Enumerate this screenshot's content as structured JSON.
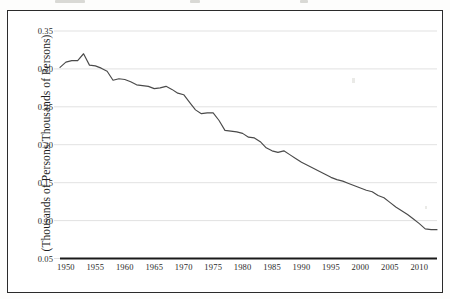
{
  "figure": {
    "background_color": "#ffffff",
    "frame_color": "#2b2b2b",
    "gridline_color": "#d9d9d9",
    "line_color": "#4a4a4a",
    "axis_color": "#1a1a1a"
  },
  "axes": {
    "ylabel": "(Thousands of Persons/Thousands of Persons)",
    "xlabel": "",
    "yticks": [
      "0.35",
      "0.30",
      "0.25",
      "0.20",
      "0.15",
      "0.10",
      "0.05"
    ],
    "xticks": [
      "1950",
      "1955",
      "1960",
      "1965",
      "1970",
      "1975",
      "1980",
      "1985",
      "1990",
      "1995",
      "2000",
      "2005",
      "2010"
    ]
  },
  "chart_data": {
    "type": "line",
    "title": "",
    "subtitle": "",
    "xlabel": "",
    "ylabel": "(Thousands of Persons/Thousands of Persons)",
    "xlim": [
      1949,
      2013
    ],
    "ylim": [
      0.05,
      0.35
    ],
    "grid": true,
    "legend": false,
    "legend_position": "none",
    "xticks": [
      1950,
      1955,
      1960,
      1965,
      1970,
      1975,
      1980,
      1985,
      1990,
      1995,
      2000,
      2005,
      2010
    ],
    "yticks": [
      0.05,
      0.1,
      0.15,
      0.2,
      0.25,
      0.3,
      0.35
    ],
    "series": [
      {
        "name": "ratio",
        "x": [
          1949,
          1950,
          1951,
          1952,
          1953,
          1954,
          1955,
          1956,
          1957,
          1958,
          1959,
          1960,
          1961,
          1962,
          1963,
          1964,
          1965,
          1966,
          1967,
          1968,
          1969,
          1970,
          1971,
          1972,
          1973,
          1974,
          1975,
          1976,
          1977,
          1978,
          1979,
          1980,
          1981,
          1982,
          1983,
          1984,
          1985,
          1986,
          1987,
          1988,
          1989,
          1990,
          1991,
          1992,
          1993,
          1994,
          1995,
          1996,
          1997,
          1998,
          1999,
          2000,
          2001,
          2002,
          2003,
          2004,
          2005,
          2006,
          2007,
          2008,
          2009,
          2010,
          2011,
          2012,
          2013
        ],
        "y": [
          0.302,
          0.309,
          0.311,
          0.311,
          0.32,
          0.305,
          0.304,
          0.301,
          0.297,
          0.285,
          0.287,
          0.286,
          0.283,
          0.279,
          0.278,
          0.277,
          0.274,
          0.275,
          0.277,
          0.273,
          0.268,
          0.266,
          0.256,
          0.246,
          0.241,
          0.242,
          0.242,
          0.232,
          0.219,
          0.218,
          0.217,
          0.215,
          0.21,
          0.209,
          0.204,
          0.196,
          0.192,
          0.19,
          0.192,
          0.187,
          0.182,
          0.177,
          0.173,
          0.169,
          0.165,
          0.161,
          0.157,
          0.154,
          0.152,
          0.149,
          0.146,
          0.143,
          0.14,
          0.138,
          0.133,
          0.13,
          0.124,
          0.118,
          0.113,
          0.108,
          0.102,
          0.096,
          0.089,
          0.088,
          0.088
        ]
      }
    ]
  }
}
